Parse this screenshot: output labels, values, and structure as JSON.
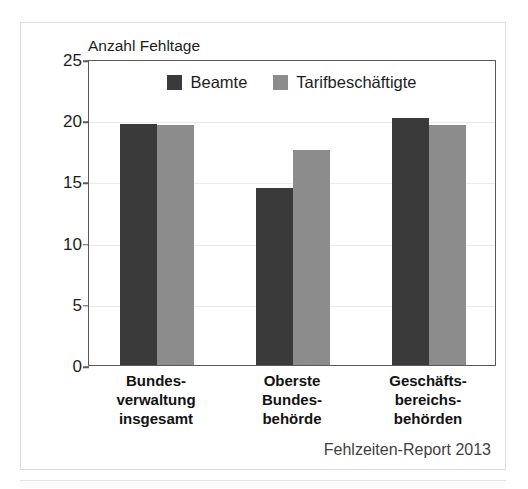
{
  "chart_data": {
    "type": "bar",
    "title": "",
    "axis_title": "Anzahl Fehltage",
    "xlabel": "",
    "ylabel": "Anzahl Fehltage",
    "ylim": [
      0,
      25
    ],
    "yticks": [
      0,
      5,
      10,
      15,
      20,
      25
    ],
    "ytick_labels": [
      "0",
      "5",
      "10",
      "15",
      "20",
      "25"
    ],
    "grid": true,
    "legend_position": "top-center",
    "categories": [
      "Bundes-\nverwaltung\ninsgesamt",
      "Oberste\nBundes-\nbehörde",
      "Geschäfts-\nbereichs-\nbehörden"
    ],
    "series": [
      {
        "name": "Beamte",
        "color": "#3a3a3a",
        "values": [
          19.7,
          14.5,
          20.2
        ]
      },
      {
        "name": "Tarifbeschäftigte",
        "color": "#8c8c8c",
        "values": [
          19.6,
          17.6,
          19.6
        ]
      }
    ],
    "source_note": "Fehlzeiten-Report 2013"
  },
  "colors": {
    "series_beamte": "#3a3a3a",
    "series_tarif": "#8c8c8c",
    "axis": "#5a5a5a",
    "grid": "#ebebeb",
    "card_border": "#dcdcdc",
    "text": "#1d1d1d"
  }
}
